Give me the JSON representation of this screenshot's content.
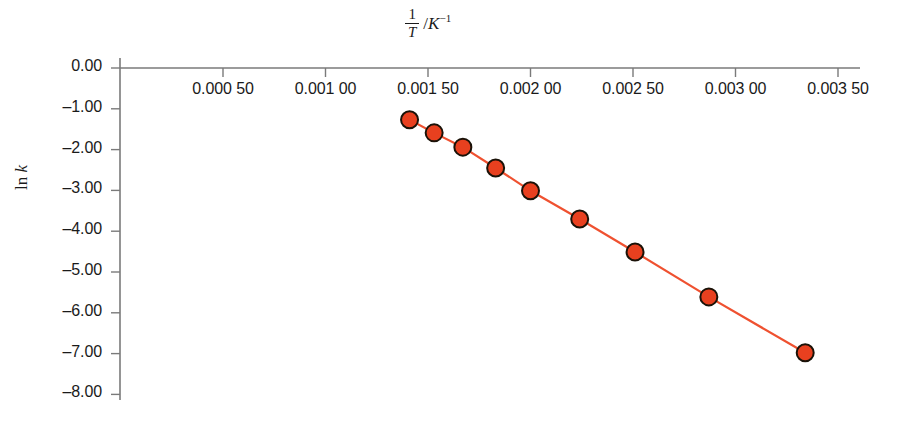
{
  "chart_data": {
    "type": "line",
    "title": "",
    "subtitle": "",
    "xlabel_parts": {
      "numerator": "1",
      "denominator": "T",
      "separator": "/",
      "unit_base": "K",
      "unit_exponent": "−1"
    },
    "xlabel": "1/T / K⁻¹",
    "ylabel": "ln k",
    "ylabel_parts": {
      "prefix": "ln ",
      "variable": "k"
    },
    "x": [
      0.00141,
      0.00153,
      0.00167,
      0.00183,
      0.002,
      0.00224,
      0.00251,
      0.00287,
      0.00334
    ],
    "values": [
      -1.27,
      -1.59,
      -1.94,
      -2.45,
      -3.01,
      -3.7,
      -4.51,
      -5.61,
      -6.98
    ],
    "xtick_labels": [
      "0.000 50",
      "0.001 00",
      "0.001 50",
      "0.002 00",
      "0.002 50",
      "0.003 00",
      "0.003 50"
    ],
    "xtick_values": [
      0.0005,
      0.001,
      0.0015,
      0.002,
      0.0025,
      0.003,
      0.0035
    ],
    "ytick_labels": [
      "0.00",
      "–1.00",
      "–2.00",
      "–3.00",
      "–4.00",
      "–5.00",
      "–6.00",
      "–7.00",
      "–8.00"
    ],
    "ytick_values": [
      0,
      -1,
      -2,
      -3,
      -4,
      -5,
      -6,
      -7,
      -8
    ],
    "xlim": [
      0.0,
      0.0037
    ],
    "ylim": [
      -8.0,
      0.0
    ],
    "grid": false,
    "legend": null,
    "colors": {
      "marker_fill": "#e8401f",
      "marker_edge": "#1a1208",
      "line": "#ef5130",
      "axis": "#7a7a7a",
      "text": "#1a1a1a",
      "background": "#ffffff"
    },
    "marker": {
      "shape": "circle",
      "radius_px": 8.5
    },
    "axis_position": {
      "x_axis": "top",
      "y_axis": "left"
    }
  }
}
